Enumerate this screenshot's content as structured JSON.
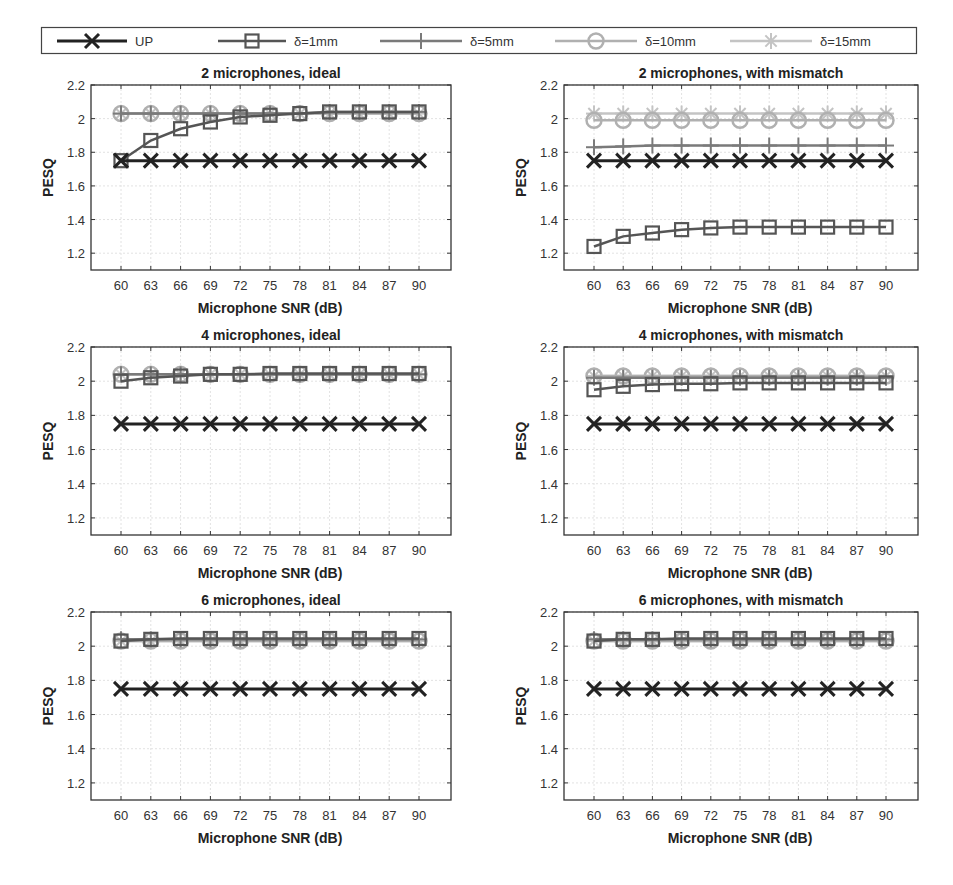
{
  "legend": {
    "items": [
      {
        "label": "UP",
        "marker": "x",
        "color": "#222222",
        "width": 3
      },
      {
        "label": "δ=1mm",
        "marker": "square",
        "color": "#555555",
        "width": 2.5
      },
      {
        "label": "δ=5mm",
        "marker": "plus",
        "color": "#7a7a7a",
        "width": 2.5
      },
      {
        "label": "δ=10mm",
        "marker": "circle",
        "color": "#b0b0b0",
        "width": 2.5
      },
      {
        "label": "δ=15mm",
        "marker": "asterisk",
        "color": "#c4c4c4",
        "width": 2.5
      }
    ]
  },
  "chart_data": [
    {
      "type": "line",
      "title": "2 microphones, ideal",
      "xlabel": "Microphone SNR (dB)",
      "ylabel": "PESQ",
      "x": [
        60,
        63,
        66,
        69,
        72,
        75,
        78,
        81,
        84,
        87,
        90
      ],
      "yticks": [
        "1.2",
        "1.4",
        "1.6",
        "1.8",
        "2",
        "2.2"
      ],
      "ylim": [
        1.1,
        2.2
      ],
      "grid": true,
      "series": [
        {
          "name": "UP",
          "values": [
            1.75,
            1.75,
            1.75,
            1.75,
            1.75,
            1.75,
            1.75,
            1.75,
            1.75,
            1.75,
            1.75
          ]
        },
        {
          "name": "δ=1mm",
          "values": [
            1.75,
            1.87,
            1.94,
            1.98,
            2.01,
            2.02,
            2.03,
            2.04,
            2.04,
            2.04,
            2.04
          ]
        },
        {
          "name": "δ=5mm",
          "values": [
            2.03,
            2.03,
            2.03,
            2.03,
            2.03,
            2.03,
            2.03,
            2.04,
            2.04,
            2.04,
            2.04
          ]
        },
        {
          "name": "δ=10mm",
          "values": [
            2.03,
            2.03,
            2.03,
            2.03,
            2.03,
            2.03,
            2.03,
            2.03,
            2.03,
            2.03,
            2.03
          ]
        },
        {
          "name": "δ=15mm",
          "values": [
            2.03,
            2.03,
            2.03,
            2.03,
            2.03,
            2.03,
            2.03,
            2.03,
            2.03,
            2.03,
            2.03
          ]
        }
      ]
    },
    {
      "type": "line",
      "title": "2 microphones, with mismatch",
      "xlabel": "Microphone SNR (dB)",
      "ylabel": "PESQ",
      "x": [
        60,
        63,
        66,
        69,
        72,
        75,
        78,
        81,
        84,
        87,
        90
      ],
      "yticks": [
        "1.2",
        "1.4",
        "1.6",
        "1.8",
        "2",
        "2.2"
      ],
      "ylim": [
        1.1,
        2.2
      ],
      "grid": true,
      "series": [
        {
          "name": "UP",
          "values": [
            1.75,
            1.75,
            1.75,
            1.75,
            1.75,
            1.75,
            1.75,
            1.75,
            1.75,
            1.75,
            1.75
          ]
        },
        {
          "name": "δ=1mm",
          "values": [
            1.24,
            1.3,
            1.32,
            1.34,
            1.35,
            1.355,
            1.355,
            1.355,
            1.355,
            1.355,
            1.355
          ]
        },
        {
          "name": "δ=5mm",
          "values": [
            1.83,
            1.835,
            1.84,
            1.84,
            1.84,
            1.84,
            1.84,
            1.84,
            1.84,
            1.84,
            1.84
          ]
        },
        {
          "name": "δ=10mm",
          "values": [
            1.99,
            1.99,
            1.99,
            1.99,
            1.99,
            1.99,
            1.99,
            1.99,
            1.99,
            1.99,
            1.99
          ]
        },
        {
          "name": "δ=15mm",
          "values": [
            2.03,
            2.03,
            2.03,
            2.03,
            2.03,
            2.03,
            2.03,
            2.03,
            2.03,
            2.03,
            2.03
          ]
        }
      ]
    },
    {
      "type": "line",
      "title": "4 microphones, ideal",
      "xlabel": "Microphone SNR (dB)",
      "ylabel": "PESQ",
      "x": [
        60,
        63,
        66,
        69,
        72,
        75,
        78,
        81,
        84,
        87,
        90
      ],
      "yticks": [
        "1.2",
        "1.4",
        "1.6",
        "1.8",
        "2",
        "2.2"
      ],
      "ylim": [
        1.1,
        2.2
      ],
      "grid": true,
      "series": [
        {
          "name": "UP",
          "values": [
            1.75,
            1.75,
            1.75,
            1.75,
            1.75,
            1.75,
            1.75,
            1.75,
            1.75,
            1.75,
            1.75
          ]
        },
        {
          "name": "δ=1mm",
          "values": [
            2.0,
            2.02,
            2.03,
            2.04,
            2.04,
            2.045,
            2.045,
            2.045,
            2.045,
            2.045,
            2.045
          ]
        },
        {
          "name": "δ=5mm",
          "values": [
            2.04,
            2.04,
            2.04,
            2.04,
            2.04,
            2.04,
            2.04,
            2.04,
            2.04,
            2.04,
            2.04
          ]
        },
        {
          "name": "δ=10mm",
          "values": [
            2.04,
            2.04,
            2.04,
            2.04,
            2.04,
            2.04,
            2.04,
            2.04,
            2.04,
            2.04,
            2.04
          ]
        },
        {
          "name": "δ=15mm",
          "values": [
            2.04,
            2.04,
            2.04,
            2.04,
            2.04,
            2.04,
            2.04,
            2.04,
            2.04,
            2.04,
            2.04
          ]
        }
      ]
    },
    {
      "type": "line",
      "title": "4 microphones, with mismatch",
      "xlabel": "Microphone SNR (dB)",
      "ylabel": "PESQ",
      "x": [
        60,
        63,
        66,
        69,
        72,
        75,
        78,
        81,
        84,
        87,
        90
      ],
      "yticks": [
        "1.2",
        "1.4",
        "1.6",
        "1.8",
        "2",
        "2.2"
      ],
      "ylim": [
        1.1,
        2.2
      ],
      "grid": true,
      "series": [
        {
          "name": "UP",
          "values": [
            1.75,
            1.75,
            1.75,
            1.75,
            1.75,
            1.75,
            1.75,
            1.75,
            1.75,
            1.75,
            1.75
          ]
        },
        {
          "name": "δ=1mm",
          "values": [
            1.95,
            1.97,
            1.98,
            1.985,
            1.985,
            1.99,
            1.99,
            1.99,
            1.99,
            1.99,
            1.99
          ]
        },
        {
          "name": "δ=5mm",
          "values": [
            2.02,
            2.02,
            2.02,
            2.02,
            2.02,
            2.02,
            2.02,
            2.02,
            2.02,
            2.02,
            2.02
          ]
        },
        {
          "name": "δ=10mm",
          "values": [
            2.03,
            2.03,
            2.03,
            2.03,
            2.03,
            2.03,
            2.03,
            2.03,
            2.03,
            2.03,
            2.03
          ]
        },
        {
          "name": "δ=15mm",
          "values": [
            2.03,
            2.03,
            2.03,
            2.03,
            2.03,
            2.03,
            2.03,
            2.03,
            2.03,
            2.03,
            2.03
          ]
        }
      ]
    },
    {
      "type": "line",
      "title": "6 microphones, ideal",
      "xlabel": "Microphone SNR (dB)",
      "ylabel": "PESQ",
      "x": [
        60,
        63,
        66,
        69,
        72,
        75,
        78,
        81,
        84,
        87,
        90
      ],
      "yticks": [
        "1.2",
        "1.4",
        "1.6",
        "1.8",
        "2",
        "2.2"
      ],
      "ylim": [
        1.1,
        2.2
      ],
      "grid": true,
      "series": [
        {
          "name": "UP",
          "values": [
            1.75,
            1.75,
            1.75,
            1.75,
            1.75,
            1.75,
            1.75,
            1.75,
            1.75,
            1.75,
            1.75
          ]
        },
        {
          "name": "δ=1mm",
          "values": [
            2.03,
            2.04,
            2.045,
            2.045,
            2.045,
            2.045,
            2.045,
            2.045,
            2.045,
            2.045,
            2.045
          ]
        },
        {
          "name": "δ=5mm",
          "values": [
            2.04,
            2.04,
            2.04,
            2.04,
            2.04,
            2.04,
            2.04,
            2.04,
            2.04,
            2.04,
            2.04
          ]
        },
        {
          "name": "δ=10mm",
          "values": [
            2.03,
            2.03,
            2.03,
            2.03,
            2.03,
            2.03,
            2.03,
            2.03,
            2.03,
            2.03,
            2.03
          ]
        },
        {
          "name": "δ=15mm",
          "values": [
            2.03,
            2.03,
            2.03,
            2.03,
            2.03,
            2.03,
            2.03,
            2.03,
            2.03,
            2.03,
            2.03
          ]
        }
      ]
    },
    {
      "type": "line",
      "title": "6 microphones, with mismatch",
      "xlabel": "Microphone SNR (dB)",
      "ylabel": "PESQ",
      "x": [
        60,
        63,
        66,
        69,
        72,
        75,
        78,
        81,
        84,
        87,
        90
      ],
      "yticks": [
        "1.2",
        "1.4",
        "1.6",
        "1.8",
        "2",
        "2.2"
      ],
      "ylim": [
        1.1,
        2.2
      ],
      "grid": true,
      "series": [
        {
          "name": "UP",
          "values": [
            1.75,
            1.75,
            1.75,
            1.75,
            1.75,
            1.75,
            1.75,
            1.75,
            1.75,
            1.75,
            1.75
          ]
        },
        {
          "name": "δ=1mm",
          "values": [
            2.03,
            2.04,
            2.04,
            2.045,
            2.045,
            2.045,
            2.045,
            2.045,
            2.045,
            2.045,
            2.045
          ]
        },
        {
          "name": "δ=5mm",
          "values": [
            2.04,
            2.04,
            2.04,
            2.04,
            2.04,
            2.04,
            2.04,
            2.04,
            2.04,
            2.04,
            2.04
          ]
        },
        {
          "name": "δ=10mm",
          "values": [
            2.03,
            2.03,
            2.03,
            2.03,
            2.03,
            2.03,
            2.03,
            2.03,
            2.03,
            2.03,
            2.03
          ]
        },
        {
          "name": "δ=15mm",
          "values": [
            2.03,
            2.03,
            2.03,
            2.03,
            2.03,
            2.03,
            2.03,
            2.03,
            2.03,
            2.03,
            2.03
          ]
        }
      ]
    }
  ]
}
